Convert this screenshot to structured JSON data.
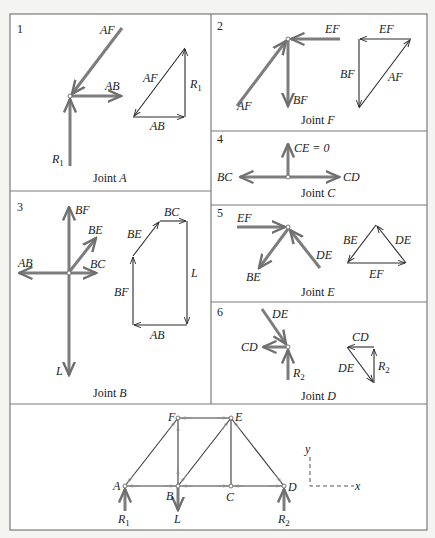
{
  "panels": [
    {
      "number": "1",
      "caption": "Joint A",
      "caption_joint": "A",
      "labels": {
        "AF": "AF",
        "AB": "AB",
        "R1": "R",
        "R1_sub": "1",
        "tri_AF": "AF",
        "tri_R1": "R",
        "tri_R1_sub": "1",
        "tri_AB": "AB"
      }
    },
    {
      "number": "2",
      "caption": "Joint F",
      "caption_joint": "F",
      "labels": {
        "EF": "EF",
        "AF": "AF",
        "BF": "BF",
        "tri_EF": "EF",
        "tri_BF": "BF",
        "tri_AF": "AF"
      }
    },
    {
      "number": "3",
      "caption": "Joint B",
      "caption_joint": "B",
      "labels": {
        "BF": "BF",
        "BE": "BE",
        "AB": "AB",
        "BC": "BC",
        "L": "L",
        "poly_BC": "BC",
        "poly_BE": "BE",
        "poly_L": "L",
        "poly_BF": "BF",
        "poly_AB": "AB"
      }
    },
    {
      "number": "4",
      "caption": "Joint C",
      "caption_joint": "C",
      "labels": {
        "CE": "CE = 0",
        "BC": "BC",
        "CD": "CD"
      }
    },
    {
      "number": "5",
      "caption": "Joint E",
      "caption_joint": "E",
      "labels": {
        "EF": "EF",
        "BE": "BE",
        "DE": "DE",
        "tri_BE": "BE",
        "tri_DE": "DE",
        "tri_EF": "EF"
      }
    },
    {
      "number": "6",
      "caption": "Joint D",
      "caption_joint": "D",
      "labels": {
        "DE": "DE",
        "CD": "CD",
        "R2": "R",
        "R2_sub": "2",
        "tri_CD": "CD",
        "tri_DE": "DE",
        "tri_R2": "R",
        "tri_R2_sub": "2"
      }
    }
  ],
  "truss": {
    "nodes": {
      "A": "A",
      "B": "B",
      "C": "C",
      "D": "D",
      "E": "E",
      "F": "F"
    },
    "loads": {
      "R1": "R",
      "R1_sub": "1",
      "L": "L",
      "R2": "R",
      "R2_sub": "2"
    },
    "axes": {
      "x": "x",
      "y": "y"
    }
  },
  "colors": {
    "force_arrow": "#7d7d7d",
    "polygon_line": "#2a2a2a",
    "frame": "#7a7a7a"
  }
}
